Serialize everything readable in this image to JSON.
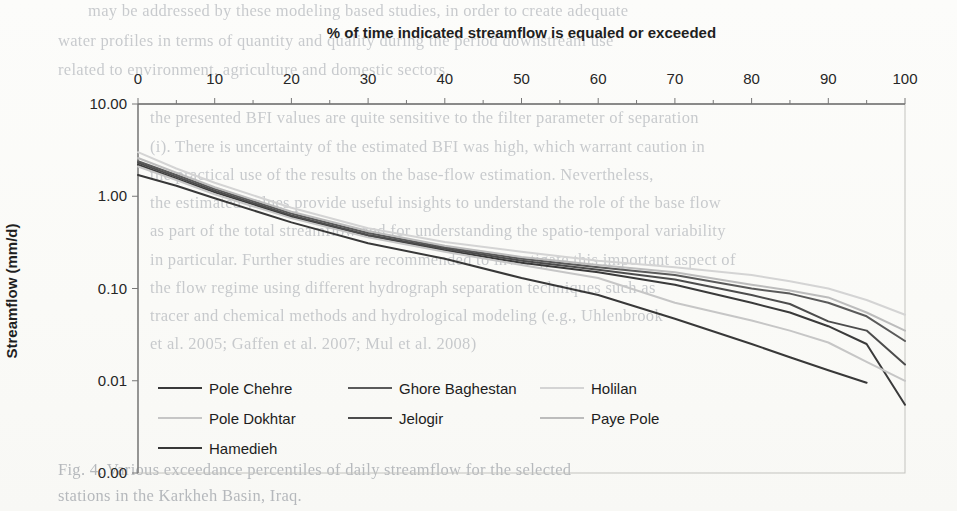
{
  "page": {
    "background_color": "#fbfbf8"
  },
  "chart_data": {
    "type": "line",
    "title": "% of time indicated streamflow is equaled or exceeded",
    "xlabel": "% of time indicated streamflow is equaled or exceeded",
    "ylabel": "Streamflow (mm/d)",
    "grid": false,
    "x_axis": {
      "position": "top",
      "min": 0,
      "max": 100,
      "tick_interval": 10,
      "minor_tick_interval": 5,
      "tick_labels": [
        "0",
        "10",
        "20",
        "30",
        "40",
        "50",
        "60",
        "70",
        "80",
        "90",
        "100"
      ]
    },
    "y_axis": {
      "scale": "log",
      "tick_values": [
        10,
        1,
        0.1,
        0.01,
        0.001
      ],
      "tick_labels": [
        "10.00",
        "1.00",
        "0.10",
        "0.01",
        "0.00"
      ]
    },
    "x": [
      0,
      5,
      10,
      20,
      30,
      40,
      50,
      60,
      70,
      80,
      85,
      90,
      95,
      100
    ],
    "series": [
      {
        "name": "Pole Chehre",
        "color": "#3a3a3a",
        "values": [
          2.2,
          1.55,
          1.1,
          0.6,
          0.37,
          0.26,
          0.19,
          0.15,
          0.11,
          0.07,
          0.055,
          0.039,
          0.025,
          0.0055
        ]
      },
      {
        "name": "Ghore Baghestan",
        "color": "#5a5a5a",
        "values": [
          2.4,
          1.7,
          1.2,
          0.65,
          0.4,
          0.28,
          0.21,
          0.17,
          0.14,
          0.1,
          0.088,
          0.07,
          0.05,
          0.027
        ]
      },
      {
        "name": "Holilan",
        "color": "#d4d4d4",
        "values": [
          3.0,
          2.0,
          1.4,
          0.75,
          0.45,
          0.32,
          0.25,
          0.2,
          0.17,
          0.14,
          0.12,
          0.1,
          0.075,
          0.052
        ]
      },
      {
        "name": "Pole Dokhtar",
        "color": "#c6c6c6",
        "values": [
          2.1,
          1.5,
          1.05,
          0.58,
          0.36,
          0.25,
          0.18,
          0.13,
          0.07,
          0.045,
          0.035,
          0.026,
          0.016,
          0.01
        ]
      },
      {
        "name": "Jelogir",
        "color": "#4c4c4c",
        "values": [
          2.3,
          1.62,
          1.15,
          0.62,
          0.38,
          0.27,
          0.2,
          0.16,
          0.125,
          0.085,
          0.068,
          0.044,
          0.035,
          0.015
        ]
      },
      {
        "name": "Paye Pole",
        "color": "#bcbcbc",
        "values": [
          2.6,
          1.8,
          1.25,
          0.68,
          0.42,
          0.29,
          0.22,
          0.18,
          0.15,
          0.11,
          0.095,
          0.08,
          0.055,
          0.035
        ]
      },
      {
        "name": "Hamedieh",
        "color": "#383838",
        "values": [
          1.7,
          1.3,
          0.95,
          0.52,
          0.31,
          0.21,
          0.13,
          0.085,
          0.047,
          0.025,
          0.018,
          0.013,
          0.0095,
          null
        ]
      }
    ],
    "legend": {
      "position": "inside-bottom-left",
      "rows": [
        [
          "Pole Chehre",
          "Ghore Baghestan",
          "Holilan"
        ],
        [
          "Pole Dokhtar",
          "Jelogir",
          "Paye Pole"
        ],
        [
          "Hamedieh"
        ]
      ]
    }
  },
  "background_bleed": {
    "lines": [
      {
        "x": 88,
        "y": 1,
        "text": "may be addressed by these modeling based studies, in order to create adequate"
      },
      {
        "x": 58,
        "y": 31,
        "text": "water profiles in terms of quantity and quality during the period downstream use"
      },
      {
        "x": 58,
        "y": 60,
        "text": "related to environment, agriculture and domestic sectors."
      },
      {
        "x": 150,
        "y": 108,
        "text": "the presented BFI values are quite sensitive to the filter parameter of separation"
      },
      {
        "x": 150,
        "y": 137,
        "text": "(i). There is uncertainty of the estimated BFI was high, which warrant caution in"
      },
      {
        "x": 150,
        "y": 165,
        "text": "the practical use of the results on the base-flow estimation. Nevertheless,"
      },
      {
        "x": 150,
        "y": 193,
        "text": "the estimated values provide useful insights to understand the role of the base flow"
      },
      {
        "x": 150,
        "y": 221,
        "text": "as part of the total streamflow and for understanding the spatio-temporal variability"
      },
      {
        "x": 150,
        "y": 250,
        "text": "in particular. Further studies are recommended to investigate this important aspect of"
      },
      {
        "x": 150,
        "y": 278,
        "text": "the flow regime using different hydrograph separation techniques such as"
      },
      {
        "x": 150,
        "y": 306,
        "text": "tracer and chemical methods and hydrological modeling (e.g., Uhlenbrook"
      },
      {
        "x": 150,
        "y": 334,
        "text": "et al. 2005; Gaffen et al. 2007; Mul et al. 2008)"
      },
      {
        "x": 58,
        "y": 460,
        "text": "Fig. 4. Various exceedance percentiles of daily streamflow for the selected",
        "caption": true
      },
      {
        "x": 58,
        "y": 486,
        "text": "stations in the Karkheh Basin, Iraq.",
        "caption": true
      }
    ]
  }
}
